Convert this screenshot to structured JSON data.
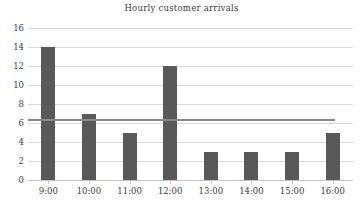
{
  "chart_data": {
    "type": "bar",
    "title": "Hourly customer arrivals",
    "xlabel": "",
    "ylabel": "",
    "categories": [
      "9:00",
      "10:00",
      "11:00",
      "12:00",
      "13:00",
      "14:00",
      "15:00",
      "16:00"
    ],
    "values": [
      14,
      7,
      5,
      12,
      3,
      3,
      3,
      5
    ],
    "ylim": [
      0,
      16
    ],
    "yticks": [
      0,
      2,
      4,
      6,
      8,
      10,
      12,
      14,
      16
    ],
    "ytick_labels": [
      "0",
      "2",
      "4",
      "6",
      "8",
      "10",
      "12",
      "14",
      "16"
    ],
    "grid": true,
    "legend": "none",
    "series": [
      {
        "name": "Hourly arrivals",
        "type": "bar",
        "color": "#595959",
        "values": [
          14,
          7,
          5,
          12,
          3,
          3,
          3,
          5
        ]
      },
      {
        "name": "Average line",
        "type": "line",
        "color": "#8a8a8a",
        "value": 6.4
      }
    ],
    "annotations": []
  },
  "colors": {
    "bar": "#595959",
    "average_line": "#8a8a8a",
    "gridline": "#d9d9d9",
    "axis": "#c4c4c4",
    "text": "#3c3c3c",
    "background": "#ffffff"
  }
}
